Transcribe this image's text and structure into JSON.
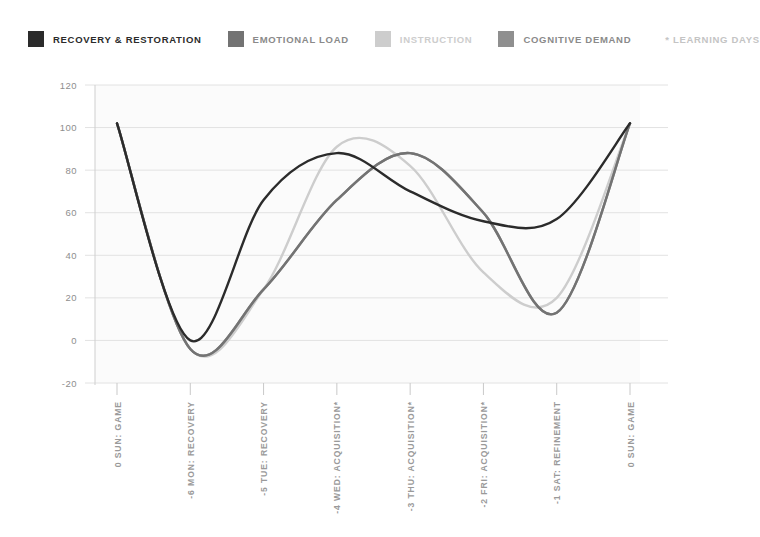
{
  "legend": {
    "items": [
      {
        "label": "RECOVERY & RESTORATION",
        "color": "#2b2b2b",
        "swatch_name": "legend-swatch-recovery"
      },
      {
        "label": "EMOTIONAL LOAD",
        "color": "#737373",
        "swatch_name": "legend-swatch-emotional-load"
      },
      {
        "label": "INSTRUCTION",
        "color": "#cdcdcd",
        "swatch_name": "legend-swatch-instruction"
      },
      {
        "label": "COGNITIVE DEMAND",
        "color": "#8f8f8f",
        "swatch_name": "legend-swatch-cognitive-demand"
      }
    ],
    "note": "* LEARNING DAYS"
  },
  "chart_data": {
    "type": "line",
    "title": "",
    "subtitle": "",
    "xlabel": "",
    "ylabel": "",
    "grid": true,
    "legend_position": "top",
    "ylim": [
      -20,
      120
    ],
    "yticks": [
      120,
      100,
      80,
      60,
      40,
      20,
      0,
      -20
    ],
    "ytick_labels": [
      "120",
      "100",
      "80",
      "60",
      "40",
      "20",
      "0",
      "-20"
    ],
    "categories": [
      "0 SUN: GAME",
      "-6 MON: RECOVERY",
      "-5 TUE: RECOVERY",
      "-4 WED: ACQUISITION*",
      "-3 THU: ACQUISITION*",
      "-2 FRI: ACQUISITION*",
      "-1 SAT: REFINEMENT",
      "0 SUN: GAME"
    ],
    "x": [
      0,
      1,
      2,
      3,
      4,
      5,
      6,
      7
    ],
    "series": [
      {
        "name": "RECOVERY & RESTORATION",
        "color": "#2b2b2b",
        "values": [
          102,
          0,
          66,
          88,
          70,
          56,
          57,
          102
        ]
      },
      {
        "name": "EMOTIONAL LOAD",
        "color": "#737373",
        "values": [
          102,
          -4,
          24,
          66,
          88,
          60,
          13,
          102
        ]
      },
      {
        "name": "INSTRUCTION",
        "color": "#cdcdcd",
        "values": [
          102,
          -4,
          24,
          91,
          82,
          32,
          20,
          102
        ]
      },
      {
        "name": "COGNITIVE DEMAND",
        "color": "#8f8f8f",
        "values": [
          102,
          -4,
          24,
          66,
          88,
          60,
          13,
          102
        ]
      }
    ]
  }
}
